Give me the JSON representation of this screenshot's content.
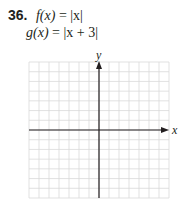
{
  "problem": {
    "number": "36.",
    "f_lhs": "f(x)",
    "f_rhs": "= |x|",
    "g_lhs": "g(x)",
    "g_rhs": "= |x + 3|"
  },
  "graph": {
    "x_axis_label": "x",
    "y_axis_label": "y",
    "grid_columns": 14,
    "grid_rows": 14,
    "grid_color": "#d9d9d9",
    "axis_color": "#231f20"
  }
}
